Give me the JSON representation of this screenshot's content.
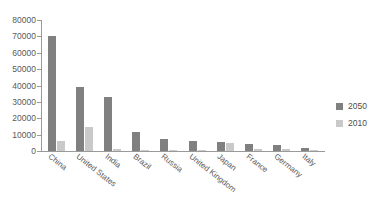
{
  "chart_data": {
    "type": "bar",
    "title": "",
    "subtitle": "",
    "xlabel": "",
    "ylabel": "",
    "ylim": [
      0,
      80000
    ],
    "yticks": [
      "0",
      "10000",
      "20000",
      "30000",
      "40000",
      "50000",
      "60000",
      "70000",
      "80000"
    ],
    "ytick_values": [
      0,
      10000,
      20000,
      30000,
      40000,
      50000,
      60000,
      70000,
      80000
    ],
    "grid": false,
    "legend_position": "right",
    "categories": [
      "China",
      "United States",
      "India",
      "Brazil",
      "Russia",
      "United Kingdom",
      "Japan",
      "France",
      "Germany",
      "Italy"
    ],
    "series": [
      {
        "name": "2050",
        "color": "#808080",
        "values": [
          70500,
          38800,
          33000,
          11400,
          7500,
          6000,
          5600,
          4400,
          3600,
          2100
        ]
      },
      {
        "name": "2010",
        "color": "#c9c9c9",
        "values": [
          5900,
          14500,
          1300,
          900,
          800,
          900,
          4900,
          1100,
          1000,
          600
        ]
      }
    ]
  },
  "legend": {
    "entries": [
      {
        "label": "2050",
        "swatch": "legend-swatch-2050"
      },
      {
        "label": "2010",
        "swatch": "legend-swatch-2010"
      }
    ]
  }
}
